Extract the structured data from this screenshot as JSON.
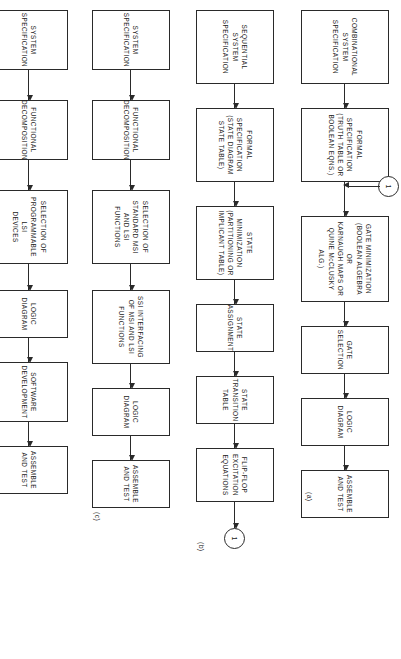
{
  "figure": {
    "type": "flowchart",
    "orientation": "rotated-90",
    "panels": [
      {
        "id": "a",
        "label": "(a)",
        "nodes": [
          "COMBINATIONAL\nSYSTEM\nSPECIFICATION",
          "FORMAL SPECIFICATION\n(TRUTH TABLE OR\nBOOLEAN EQNS.)",
          "GATE MINIMIZATION\n(BOOLEAN ALGEBRA OR\nKARNAUGH MAPS OR\nQUINE McCLUSKY ALG.)",
          "GATE SELECTION",
          "LOGIC DIAGRAM",
          "ASSEMBLE AND TEST"
        ],
        "connector_in": "1"
      },
      {
        "id": "b",
        "label": "(b)",
        "nodes": [
          "SEQUENTIAL SYSTEM\nSPECIFICATION",
          "FORMAL SPECIFICATION\n(STATE DIAGRAM\nSTATE TABLE)",
          "STATE MINIMIZATION\n(PARTITIONING OR\nIMPLICANT TABLE)",
          "STATE ASSIGNMENT",
          "STATE TRANSITION\nTABLE",
          "FLIP-FLOP EXCITATION\nEQUATIONS"
        ],
        "connector_out": "1"
      },
      {
        "id": "c",
        "label": "(c)",
        "nodes": [
          "SYSTEM\nSPECIFICATION",
          "FUNCTIONAL\nDECOMPOSITION",
          "SELECTION OF\nSTANDARD MSI\nAND LSI FUNCTIONS",
          "SSI INTERFACING\nOF MSI AND LSI\nFUNCTIONS",
          "LOGIC DIAGRAM",
          "ASSEMBLE AND TEST"
        ]
      },
      {
        "id": "d",
        "label": "(d)",
        "nodes": [
          "SYSTEM\nSPECIFICATION",
          "FUNCTIONAL\nDECOMPOSITION",
          "SELECTION OF\nPROGRAMMABLE LSI\nDEVICES",
          "LOGIC DIAGRAM",
          "SOFTWARE\nDEVELOPMENT",
          "ASSEMBLE AND TEST"
        ]
      }
    ],
    "colors": {
      "stroke": "#2a2a2a",
      "fill": "#ffffff",
      "text": "#1a1a1a"
    }
  }
}
